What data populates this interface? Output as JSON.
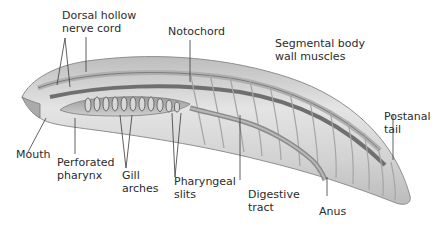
{
  "colors": {
    "body_light": "#e6e6e6",
    "body_mid": "#c4c4c4",
    "body_dark": "#8a8a8a",
    "structure_dark": "#6a6a6a",
    "leader_line": "#3a3a3a",
    "label_text": "#2b2b2b"
  },
  "labels": {
    "dorsal_nerve_cord": "Dorsal hollow\nnerve cord",
    "notochord": "Notochord",
    "segmental_muscles": "Segmental body\nwall muscles",
    "postanal_tail": "Postanal\ntail",
    "mouth": "Mouth",
    "perforated_pharynx": "Perforated\npharynx",
    "gill_arches": "Gill\narches",
    "pharyngeal_slits": "Pharyngeal\nslits",
    "digestive_tract": "Digestive\ntract",
    "anus": "Anus"
  }
}
